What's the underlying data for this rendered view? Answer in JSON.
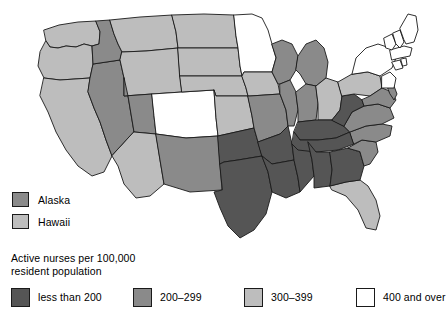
{
  "figure": {
    "title": "Active nurses per 100,000 resident population",
    "type": "choropleth-map",
    "region": "United States"
  },
  "legend": {
    "title": "Active nurses per 100,000\nresident population",
    "classes": [
      {
        "label": "less than 200",
        "color": "#555555",
        "left": 0
      },
      {
        "label": "200–299",
        "color": "#8a8a8a",
        "left": 122
      },
      {
        "label": "300–399",
        "color": "#bdbdbd",
        "left": 233
      },
      {
        "label": "400 and over",
        "color": "#ffffff",
        "left": 345
      }
    ]
  },
  "inset_legend": {
    "rows": [
      {
        "label": "Alaska",
        "color": "#8a8a8a"
      },
      {
        "label": "Hawaii",
        "color": "#bdbdbd"
      }
    ]
  },
  "chart_data": {
    "type": "heatmap",
    "title": "Active nurses per 100,000 resident population",
    "xlabel": "",
    "ylabel": "",
    "legend_position": "bottom",
    "grid": false,
    "classes": [
      {
        "name": "less than 200",
        "color": "#555555",
        "min": 0,
        "max": 199
      },
      {
        "name": "200-299",
        "color": "#8a8a8a",
        "min": 200,
        "max": 299
      },
      {
        "name": "300-399",
        "color": "#bdbdbd",
        "min": 300,
        "max": 399
      },
      {
        "name": "400 and over",
        "color": "#ffffff",
        "min": 400,
        "max": null
      }
    ],
    "categories": [
      "WA",
      "OR",
      "CA",
      "NV",
      "ID",
      "MT",
      "WY",
      "UT",
      "AZ",
      "CO",
      "NM",
      "ND",
      "SD",
      "NE",
      "KS",
      "OK",
      "TX",
      "MN",
      "IA",
      "MO",
      "AR",
      "LA",
      "WI",
      "IL",
      "MS",
      "MI",
      "IN",
      "OH",
      "KY",
      "TN",
      "AL",
      "FL",
      "GA",
      "SC",
      "NC",
      "VA",
      "WV",
      "PA",
      "NY",
      "MD",
      "DE",
      "NJ",
      "CT",
      "RI",
      "MA",
      "VT",
      "NH",
      "ME",
      "AK",
      "HI"
    ],
    "values": [
      "300-399",
      "300-399",
      "300-399",
      "200-299",
      "200-299",
      "300-399",
      "300-399",
      "200-299",
      "300-399",
      "400 and over",
      "200-299",
      "300-399",
      "300-399",
      "300-399",
      "300-399",
      "less than 200",
      "less than 200",
      "400 and over",
      "300-399",
      "200-299",
      "less than 200",
      "less than 200",
      "200-299",
      "200-299",
      "less than 200",
      "200-299",
      "200-299",
      "300-399",
      "less than 200",
      "less than 200",
      "less than 200",
      "300-399",
      "less than 200",
      "200-299",
      "200-299",
      "200-299",
      "less than 200",
      "300-399",
      "400 and over",
      "200-299",
      "200-299",
      "400 and over",
      "400 and over",
      "400 and over",
      "400 and over",
      "400 and over",
      "400 and over",
      "400 and over",
      "200-299",
      "300-399"
    ]
  },
  "map_states": [
    {
      "id": "WA",
      "name": "Washington",
      "class": "300-399",
      "color": "#bdbdbd",
      "d": "M44,30 L59,25 L78,22 L96,21 L100,32 L99,44 L92,46 L84,44 L76,47 L66,46 L58,48 L50,47 L46,41 Z"
    },
    {
      "id": "OR",
      "name": "Oregon",
      "class": "300-399",
      "color": "#bdbdbd",
      "d": "M46,41 L50,47 L58,48 L66,46 L76,47 L84,44 L92,46 L93,64 L90,78 L60,80 L44,78 L38,66 L40,52 Z"
    },
    {
      "id": "CA",
      "name": "California",
      "class": "300-399",
      "color": "#bdbdbd",
      "d": "M44,78 L60,80 L90,78 L88,92 L94,108 L100,122 L106,140 L112,156 L104,172 L92,176 L78,166 L66,150 L56,132 L48,112 L40,96 Z"
    },
    {
      "id": "NV",
      "name": "Nevada",
      "class": "200-299",
      "color": "#8a8a8a",
      "d": "M90,78 L93,64 L120,60 L124,78 L128,96 L131,114 L134,132 L112,156 L106,140 L100,122 L94,108 L88,92 Z"
    },
    {
      "id": "ID",
      "name": "Idaho",
      "class": "200-299",
      "color": "#8a8a8a",
      "d": "M96,21 L110,20 L114,34 L118,44 L122,52 L120,60 L93,64 L92,46 L99,44 L100,32 Z"
    },
    {
      "id": "MT",
      "name": "Montana",
      "class": "300-399",
      "color": "#bdbdbd",
      "d": "M110,20 L140,17 L172,15 L176,32 L178,48 L146,51 L122,52 L118,44 L114,34 Z"
    },
    {
      "id": "WY",
      "name": "Wyoming",
      "class": "300-399",
      "color": "#bdbdbd",
      "d": "M122,52 L146,51 L178,48 L180,76 L182,92 L152,94 L124,96 L124,78 L120,60 Z"
    },
    {
      "id": "UT",
      "name": "Utah",
      "class": "200-299",
      "color": "#8a8a8a",
      "d": "M124,78 L124,96 L152,94 L154,116 L156,134 L134,132 L131,114 L128,96 Z"
    },
    {
      "id": "AZ",
      "name": "Arizona",
      "class": "300-399",
      "color": "#bdbdbd",
      "d": "M134,132 L156,134 L160,160 L164,184 L150,196 L136,198 L124,184 L118,166 L112,156 Z"
    },
    {
      "id": "CO",
      "name": "Colorado",
      "class": "400 and over",
      "color": "#ffffff",
      "d": "M152,94 L182,92 L214,90 L216,118 L218,136 L186,138 L156,134 L154,116 Z"
    },
    {
      "id": "NM",
      "name": "New Mexico",
      "class": "200-299",
      "color": "#8a8a8a",
      "d": "M156,134 L186,138 L218,136 L220,164 L222,190 L190,192 L164,184 L160,160 Z"
    },
    {
      "id": "ND",
      "name": "North Dakota",
      "class": "300-399",
      "color": "#bdbdbd",
      "d": "M172,15 L204,14 L234,15 L236,36 L238,48 L206,48 L178,48 L176,32 Z"
    },
    {
      "id": "SD",
      "name": "South Dakota",
      "class": "300-399",
      "color": "#bdbdbd",
      "d": "M178,48 L206,48 L238,48 L240,66 L242,76 L210,76 L180,76 Z"
    },
    {
      "id": "NE",
      "name": "Nebraska",
      "class": "300-399",
      "color": "#bdbdbd",
      "d": "M180,76 L210,76 L242,76 L246,88 L248,96 L216,96 L214,90 L182,92 Z"
    },
    {
      "id": "KS",
      "name": "Kansas",
      "class": "300-399",
      "color": "#bdbdbd",
      "d": "M214,90 L216,96 L248,96 L252,116 L254,128 L218,136 L216,118 Z"
    },
    {
      "id": "OK",
      "name": "Oklahoma",
      "class": "less than 200",
      "color": "#555555",
      "d": "M218,136 L254,128 L258,142 L262,156 L250,158 L238,160 L224,162 L220,164 Z"
    },
    {
      "id": "TX",
      "name": "Texas",
      "class": "less than 200",
      "color": "#555555",
      "d": "M220,164 L224,162 L238,160 L250,158 L262,156 L268,172 L272,192 L266,214 L254,230 L240,238 L228,226 L220,208 L214,192 L222,190 Z"
    },
    {
      "id": "MN",
      "name": "Minnesota",
      "class": "400 and over",
      "color": "#ffffff",
      "d": "M234,15 L252,14 L262,18 L268,30 L272,44 L276,58 L272,72 L244,72 L242,76 L240,66 L238,48 L236,36 Z"
    },
    {
      "id": "IA",
      "name": "Iowa",
      "class": "300-399",
      "color": "#bdbdbd",
      "d": "M242,76 L244,72 L272,72 L278,84 L280,94 L250,96 L248,96 L246,88 Z"
    },
    {
      "id": "MO",
      "name": "Missouri",
      "class": "200-299",
      "color": "#8a8a8a",
      "d": "M248,96 L250,96 L280,94 L286,110 L288,126 L280,134 L258,142 L254,128 L252,116 Z"
    },
    {
      "id": "AR",
      "name": "Arkansas",
      "class": "less than 200",
      "color": "#555555",
      "d": "M258,142 L280,134 L288,126 L292,144 L294,160 L272,164 L262,156 Z"
    },
    {
      "id": "LA",
      "name": "Louisiana",
      "class": "less than 200",
      "color": "#555555",
      "d": "M262,156 L272,164 L294,160 L298,178 L300,192 L286,198 L272,192 L268,172 Z"
    },
    {
      "id": "WI",
      "name": "Wisconsin",
      "class": "200-299",
      "color": "#8a8a8a",
      "d": "M272,44 L282,40 L292,44 L298,56 L296,70 L290,80 L280,84 L278,84 L272,72 L276,58 Z"
    },
    {
      "id": "IL",
      "name": "Illinois",
      "class": "200-299",
      "color": "#8a8a8a",
      "d": "M280,84 L290,80 L296,92 L298,110 L294,126 L288,126 L286,110 L280,94 Z"
    },
    {
      "id": "MS",
      "name": "Mississippi",
      "class": "less than 200",
      "color": "#555555",
      "d": "M294,160 L292,144 L308,142 L312,160 L314,176 L300,192 L298,178 Z"
    },
    {
      "id": "MI",
      "name": "Michigan",
      "class": "200-299",
      "color": "#8a8a8a",
      "d": "M298,56 L306,44 L316,40 L324,48 L328,62 L326,78 L316,86 L306,84 L300,74 L296,70 Z"
    },
    {
      "id": "IN",
      "name": "Indiana",
      "class": "200-299",
      "color": "#8a8a8a",
      "d": "M296,92 L306,84 L316,86 L318,104 L316,120 L298,122 L298,110 Z"
    },
    {
      "id": "OH",
      "name": "Ohio",
      "class": "300-399",
      "color": "#bdbdbd",
      "d": "M316,86 L326,78 L338,82 L342,96 L340,110 L332,120 L318,120 L318,104 Z"
    },
    {
      "id": "KY",
      "name": "Kentucky",
      "class": "less than 200",
      "color": "#555555",
      "d": "M298,122 L316,120 L332,120 L344,126 L350,132 L336,138 L318,140 L300,140 L294,132 Z"
    },
    {
      "id": "TN",
      "name": "Tennessee",
      "class": "less than 200",
      "color": "#555555",
      "d": "M294,132 L300,140 L318,140 L336,138 L350,132 L354,144 L338,150 L316,152 L298,150 L292,144 Z"
    },
    {
      "id": "AL",
      "name": "Alabama",
      "class": "less than 200",
      "color": "#555555",
      "d": "M308,142 L316,152 L330,152 L332,170 L330,186 L314,188 L314,176 L312,160 Z"
    },
    {
      "id": "FL",
      "name": "Florida",
      "class": "300-399",
      "color": "#bdbdbd",
      "d": "M330,186 L346,182 L360,180 L368,186 L376,200 L380,216 L376,230 L366,228 L358,210 L346,196 L332,190 Z"
    },
    {
      "id": "GA",
      "name": "Georgia",
      "class": "less than 200",
      "color": "#555555",
      "d": "M330,152 L348,148 L360,152 L364,166 L360,180 L346,182 L330,186 L332,170 Z"
    },
    {
      "id": "SC",
      "name": "South Carolina",
      "class": "200-299",
      "color": "#8a8a8a",
      "d": "M348,148 L362,140 L376,142 L378,152 L370,164 L364,166 L360,152 Z"
    },
    {
      "id": "NC",
      "name": "North Carolina",
      "class": "200-299",
      "color": "#8a8a8a",
      "d": "M350,132 L366,126 L382,124 L392,126 L390,136 L376,142 L362,140 L354,144 Z"
    },
    {
      "id": "VA",
      "name": "Virginia",
      "class": "200-299",
      "color": "#8a8a8a",
      "d": "M344,126 L352,112 L364,106 L378,104 L390,108 L394,118 L382,124 L366,126 L350,132 Z"
    },
    {
      "id": "WV",
      "name": "West Virginia",
      "class": "less than 200",
      "color": "#555555",
      "d": "M332,120 L340,110 L342,96 L354,94 L362,100 L364,106 L352,112 L344,126 Z"
    },
    {
      "id": "PA",
      "name": "Pennsylvania",
      "class": "300-399",
      "color": "#bdbdbd",
      "d": "M338,82 L352,74 L368,72 L380,76 L382,88 L370,96 L354,94 L342,96 Z"
    },
    {
      "id": "NY",
      "name": "New York",
      "class": "400 and over",
      "color": "#ffffff",
      "d": "M352,74 L356,58 L366,48 L378,44 L390,48 L396,58 L392,68 L380,76 L368,72 Z"
    },
    {
      "id": "MD",
      "name": "Maryland",
      "class": "200-299",
      "color": "#8a8a8a",
      "d": "M370,96 L382,88 L392,92 L396,100 L390,108 L378,104 L364,106 L362,100 Z"
    },
    {
      "id": "DE",
      "name": "Delaware",
      "class": "200-299",
      "color": "#8a8a8a",
      "d": "M388,88 L394,86 L397,94 L394,100 L390,94 Z"
    },
    {
      "id": "NJ",
      "name": "New Jersey",
      "class": "400 and over",
      "color": "#ffffff",
      "d": "M382,76 L390,72 L396,78 L394,88 L388,88 L382,88 Z"
    },
    {
      "id": "CT",
      "name": "Connecticut",
      "class": "400 and over",
      "color": "#ffffff",
      "d": "M392,62 L400,60 L403,68 L396,70 Z"
    },
    {
      "id": "RI",
      "name": "Rhode Island",
      "class": "400 and over",
      "color": "#ffffff",
      "d": "M401,59 L406,58 L407,65 L403,66 Z"
    },
    {
      "id": "MA",
      "name": "Massachusetts",
      "class": "400 and over",
      "color": "#ffffff",
      "d": "M390,50 L404,46 L412,48 L410,56 L400,58 L392,60 Z"
    },
    {
      "id": "VT",
      "name": "Vermont",
      "class": "400 and over",
      "color": "#ffffff",
      "d": "M384,38 L392,34 L396,44 L392,50 L386,48 Z"
    },
    {
      "id": "NH",
      "name": "New Hampshire",
      "class": "400 and over",
      "color": "#ffffff",
      "d": "M393,33 L400,30 L404,42 L400,48 L396,44 Z"
    },
    {
      "id": "ME",
      "name": "Maine",
      "class": "400 and over",
      "color": "#ffffff",
      "d": "M400,28 L408,14 L416,16 L418,30 L414,42 L406,44 L404,40 Z"
    }
  ]
}
